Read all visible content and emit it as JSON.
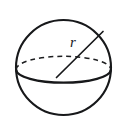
{
  "figure": {
    "name": "sphere-radius-diagram",
    "background_color": "#ffffff",
    "stroke_color": "#17181a"
  },
  "labels": {
    "radius": "r"
  },
  "geometry": {
    "sphere": {
      "center_x": 63.5,
      "center_y": 67.5,
      "radius": 47.5,
      "stroke_width": 2.1
    },
    "equator": {
      "center_x": 63.5,
      "center_y": 69.5,
      "radius_x": 47.3,
      "radius_y": 13.2,
      "front_stroke_width": 2.2,
      "back_stroke_width": 1.5,
      "back_dash": "5 4"
    },
    "radius_segment": {
      "x1": 56.5,
      "y1": 77.5,
      "x2": 103.0,
      "y2": 31.5,
      "stroke_width": 1.7
    },
    "radius_label_position": {
      "x": 73.0,
      "y": 47.0,
      "font_size": 15
    }
  }
}
